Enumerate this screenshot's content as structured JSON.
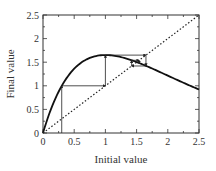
{
  "chart_data": {
    "type": "line",
    "title": "",
    "xlabel": "Initial value",
    "ylabel": "Final value",
    "xlim": [
      0,
      2.5
    ],
    "ylim": [
      0,
      2.5
    ],
    "xticks": [
      "0",
      "0.5",
      "1",
      "1.5",
      "2",
      "2.5"
    ],
    "yticks": [
      "0",
      "0.5",
      "1",
      "1.5",
      "2",
      "2.5"
    ],
    "grid": false,
    "legend": null,
    "series": [
      {
        "name": "map curve f(x) = 4.49 x e^(-x)",
        "style": "solid-thick",
        "x": [
          0,
          0.1,
          0.2,
          0.3,
          0.4,
          0.5,
          0.6,
          0.7,
          0.8,
          0.9,
          1.0,
          1.2,
          1.4,
          1.6,
          1.8,
          2.0,
          2.2,
          2.4,
          2.5
        ],
        "y": [
          0,
          0.41,
          0.74,
          1.0,
          1.2,
          1.36,
          1.48,
          1.56,
          1.61,
          1.64,
          1.65,
          1.62,
          1.55,
          1.45,
          1.34,
          1.22,
          1.09,
          0.98,
          0.92
        ]
      },
      {
        "name": "identity line y = x",
        "style": "dotted",
        "x": [
          0,
          2.5
        ],
        "y": [
          0,
          2.5
        ]
      },
      {
        "name": "cobweb path",
        "style": "thin-arrows",
        "x": [
          0.3,
          0.3,
          1.0,
          1.0,
          1.65,
          1.65,
          1.42,
          1.42,
          1.54,
          1.54
        ],
        "y": [
          0,
          1.0,
          1.0,
          1.65,
          1.65,
          1.42,
          1.42,
          1.54,
          1.54,
          1.47
        ]
      }
    ]
  }
}
